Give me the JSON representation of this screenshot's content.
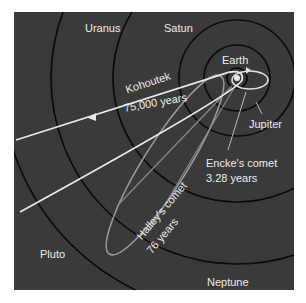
{
  "diagram": {
    "background_color": "#3a3a3a",
    "orbit_color": "#0a0a0a",
    "comet_colors": {
      "kohoutek": "#e8e8e8",
      "halley": "#9a9a9a",
      "encke": "#e0e0e0"
    },
    "planets": [
      {
        "name": "Earth"
      },
      {
        "name": "Jupiter"
      },
      {
        "name": "Satun"
      },
      {
        "name": "Uranus"
      },
      {
        "name": "Neptune"
      },
      {
        "name": "Pluto"
      }
    ],
    "comets": [
      {
        "name": "Kohoutek",
        "period": "75,000 years"
      },
      {
        "name": "Halley's comet",
        "period": "76 years"
      },
      {
        "name": "Encke's comet",
        "period": "3.28 years"
      }
    ]
  }
}
